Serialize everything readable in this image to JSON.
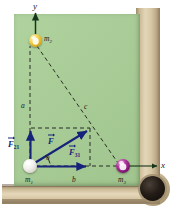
{
  "figure": {
    "scene": "billiard-table",
    "colors": {
      "felt_green": "#a9cf96",
      "wood_rail": "#d8c9a6",
      "pocket_dark": "#1a1410",
      "vector_blue": "#16237a",
      "dashed_black": "#1a1a1a",
      "ball_m2_yellow": "#f2d24e",
      "ball_m1_white": "#f4f3ef",
      "ball_m3_purple": "#b0339c"
    }
  },
  "axes": {
    "y_label": "y",
    "x_label": "x"
  },
  "masses": [
    {
      "id": "m2",
      "label": "m",
      "sub": "2",
      "ball_color": "yellow",
      "position": "top-left"
    },
    {
      "id": "m1",
      "label": "m",
      "sub": "1",
      "ball_color": "white",
      "position": "origin"
    },
    {
      "id": "m3",
      "label": "m",
      "sub": "3",
      "ball_color": "purple",
      "position": "right-on-x-axis"
    }
  ],
  "sides": [
    {
      "id": "a",
      "label": "a",
      "description": "vertical distance m1 to m2"
    },
    {
      "id": "b",
      "label": "b",
      "description": "horizontal distance m1 to m3"
    },
    {
      "id": "c",
      "label": "c",
      "description": "diagonal distance m2 to m3"
    }
  ],
  "angle": {
    "label": "θ",
    "vertex": "m1"
  },
  "vectors": [
    {
      "id": "F21",
      "letter": "F",
      "sub": "21",
      "direction": "up",
      "description": "force on m1 from m2"
    },
    {
      "id": "F31",
      "letter": "F",
      "sub": "31",
      "direction": "right",
      "description": "force on m1 from m3"
    },
    {
      "id": "F",
      "letter": "F",
      "sub": "",
      "direction": "diagonal-up-right",
      "description": "resultant force on m1"
    }
  ]
}
